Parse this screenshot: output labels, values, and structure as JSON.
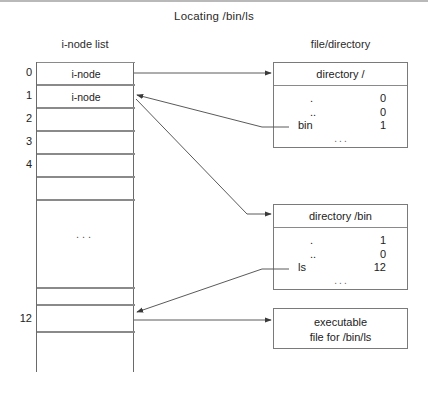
{
  "figure": {
    "title": "Locating /bin/ls",
    "headers": {
      "left": "i-node list",
      "right": "file/directory"
    }
  },
  "inode_list": {
    "labels": [
      "0",
      "1",
      "2",
      "3",
      "4",
      "12"
    ],
    "filled_rows": [
      {
        "index": "0",
        "text": "i-node"
      },
      {
        "index": "1",
        "text": "i-node"
      }
    ],
    "empty_marker": "...",
    "blank_label": ""
  },
  "boxes": {
    "root_dir": {
      "title": "directory /",
      "entries": [
        {
          "name": ".",
          "value": "0"
        },
        {
          "name": "..",
          "value": "0"
        },
        {
          "name": "bin",
          "value": "1"
        }
      ],
      "more": "..."
    },
    "bin_dir": {
      "title": "directory /bin",
      "entries": [
        {
          "name": ".",
          "value": "1"
        },
        {
          "name": "..",
          "value": "0"
        },
        {
          "name": "ls",
          "value": "12"
        }
      ],
      "more": "..."
    },
    "executable": {
      "line1": "executable",
      "line2": "file for /bin/ls"
    }
  },
  "arrows": [
    {
      "name": "inode0-to-root-dir",
      "from": "i-node 0",
      "to": "directory /"
    },
    {
      "name": "bin-entry-to-inode1",
      "from": "bin entry (1)",
      "to": "i-node 1"
    },
    {
      "name": "inode1-to-bin-dir",
      "from": "i-node 1",
      "to": "directory /bin"
    },
    {
      "name": "ls-entry-to-inode12",
      "from": "ls entry (12)",
      "to": "i-node 12"
    },
    {
      "name": "inode12-to-exec",
      "from": "i-node 12",
      "to": "executable file for /bin/ls"
    }
  ],
  "colors": {
    "ink": "#1a1a1a",
    "line": "#6a6a6a",
    "rule": "#b9b9b9"
  }
}
